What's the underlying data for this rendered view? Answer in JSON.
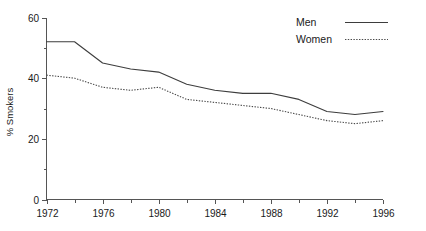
{
  "chart_data": {
    "type": "line",
    "title": "",
    "xlabel": "",
    "ylabel": "% Smokers",
    "xlim": [
      1972,
      1996
    ],
    "ylim": [
      0,
      60
    ],
    "grid": false,
    "legend_position": "top-right",
    "x": [
      1972,
      1974,
      1976,
      1978,
      1980,
      1982,
      1984,
      1986,
      1988,
      1990,
      1992,
      1994,
      1996
    ],
    "series": [
      {
        "name": "Men",
        "style": "solid",
        "color": "#3d3d3d",
        "values": [
          52,
          52,
          45,
          43,
          42,
          38,
          36,
          35,
          35,
          33,
          29,
          28,
          29
        ]
      },
      {
        "name": "Women",
        "style": "dotted",
        "color": "#4a4a4a",
        "values": [
          41,
          40,
          37,
          36,
          37,
          33,
          32,
          31,
          30,
          28,
          26,
          25,
          26
        ]
      }
    ],
    "x_ticks_major": [
      1972,
      1976,
      1980,
      1984,
      1988,
      1992,
      1996
    ],
    "x_tick_labels": [
      "1972",
      "1976",
      "1980",
      "1984",
      "1988",
      "1992",
      "1996"
    ],
    "x_ticks_minor": [
      1974,
      1978,
      1982,
      1986,
      1990,
      1994
    ],
    "y_ticks_major": [
      0,
      20,
      40,
      60
    ],
    "y_tick_labels": [
      "0",
      "20",
      "40",
      "60"
    ],
    "y_ticks_minor": [
      10,
      30,
      50
    ]
  },
  "legend": {
    "items": [
      {
        "label": "Men"
      },
      {
        "label": "Women"
      }
    ]
  },
  "axes": {
    "y_title": "% Smokers"
  }
}
